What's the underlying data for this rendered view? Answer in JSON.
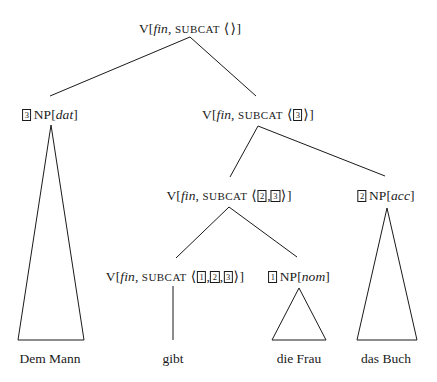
{
  "diagram": {
    "type": "syntax-tree",
    "ink_color": "#1a1a1a",
    "background_color": "#ffffff",
    "symbols": {
      "open_angle": "⟨",
      "close_angle": "⟩",
      "comma": ",",
      "open_bracket": "[",
      "close_bracket": "]"
    },
    "labels": {
      "category_v": "V",
      "category_np": "NP",
      "feature_fin": "fin",
      "feature_subcat": "SUBCAT",
      "case_dat": "dat",
      "case_acc": "acc",
      "case_nom": "nom",
      "tag_1": "1",
      "tag_2": "2",
      "tag_3": "3"
    },
    "nodes": {
      "root": {
        "x": 190,
        "y": 22,
        "text": "V[fin, SUBCAT ⟨ ⟩]"
      },
      "np_dat": {
        "x": 50,
        "y": 108,
        "text": "3 NP[dat]"
      },
      "v_subcat3": {
        "x": 258,
        "y": 108,
        "text": "V[fin, SUBCAT ⟨ 3 ⟩]"
      },
      "v_subcat23": {
        "x": 229,
        "y": 189,
        "text": "V[fin, SUBCAT ⟨ 2, 3 ⟩]"
      },
      "np_acc": {
        "x": 386,
        "y": 189,
        "text": "2 NP[acc]"
      },
      "v_subcat123": {
        "x": 175,
        "y": 270,
        "text": "V[fin, SUBCAT ⟨ 1, 2, 3 ⟩]"
      },
      "np_nom": {
        "x": 299,
        "y": 270,
        "text": "1 NP[nom]"
      }
    },
    "terminals": [
      {
        "id": "dem-mann",
        "x": 50,
        "y": 352,
        "text": "Dem Mann"
      },
      {
        "id": "gibt",
        "x": 173,
        "y": 352,
        "text": "gibt"
      },
      {
        "id": "die-frau",
        "x": 299,
        "y": 352,
        "text": "die Frau"
      },
      {
        "id": "das-buch",
        "x": 386,
        "y": 352,
        "text": "das Buch"
      }
    ],
    "edges": [
      {
        "id": "root-to-npdat",
        "x1": 190,
        "y1": 37,
        "x2": 50,
        "y2": 96
      },
      {
        "id": "root-to-vsubcat3",
        "x1": 190,
        "y1": 37,
        "x2": 256,
        "y2": 96
      },
      {
        "id": "vsubcat3-to-vsubcat23",
        "x1": 258,
        "y1": 126,
        "x2": 230,
        "y2": 177
      },
      {
        "id": "vsubcat3-to-npacc",
        "x1": 258,
        "y1": 126,
        "x2": 385,
        "y2": 176
      },
      {
        "id": "vsubcat23-to-vsubcat123",
        "x1": 229,
        "y1": 207,
        "x2": 176,
        "y2": 258
      },
      {
        "id": "vsubcat23-to-npnom",
        "x1": 229,
        "y1": 207,
        "x2": 297,
        "y2": 257
      },
      {
        "id": "vsubcat123-to-gibt",
        "x1": 173,
        "y1": 286,
        "x2": 173,
        "y2": 340
      }
    ],
    "triangles": [
      {
        "id": "dem-mann-triangle",
        "apex_x": 51,
        "apex_y": 125,
        "left_x": 18,
        "right_x": 84,
        "base_y": 340
      },
      {
        "id": "die-frau-triangle",
        "apex_x": 299,
        "apex_y": 288,
        "left_x": 272,
        "right_x": 326,
        "base_y": 340
      },
      {
        "id": "das-buch-triangle",
        "apex_x": 387,
        "apex_y": 208,
        "left_x": 357,
        "right_x": 417,
        "base_y": 340
      }
    ]
  }
}
